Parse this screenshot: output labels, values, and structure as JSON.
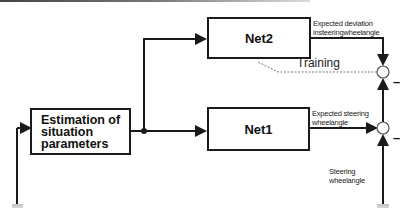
{
  "diagram": {
    "blocks": {
      "estimation": {
        "label": "Estimation of\nsituation\nparameters"
      },
      "net2": {
        "label": "Net2"
      },
      "net1": {
        "label": "Net1"
      }
    },
    "signals": {
      "net2_output": "Expected deviation\ninsteeringwheelangle",
      "net1_output": "Expected steering\nwheelangle",
      "measured_input": "Steering\nwheelangle",
      "training": "Training"
    },
    "summing_junctions": [
      {
        "id": "upper",
        "sign": "–"
      },
      {
        "id": "lower",
        "sign": "–"
      }
    ],
    "colors": {
      "line": "#1a1a1a",
      "dashed": "#777777",
      "background": "#ffffff"
    }
  }
}
